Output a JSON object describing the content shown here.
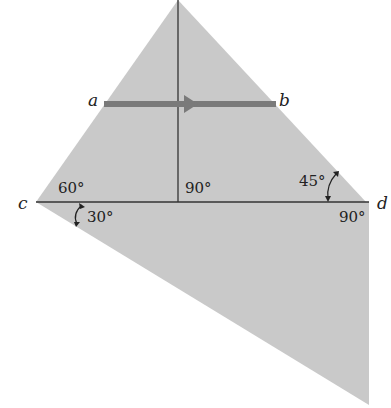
{
  "diagram": {
    "type": "prism_ray_diagram",
    "colors": {
      "prism_fill": "#c9c9c9",
      "line": "#333333",
      "ray": "#7a7a7a",
      "text": "#222222",
      "background": "#ffffff"
    },
    "points": {
      "a": "a",
      "b": "b",
      "c": "c",
      "d": "d"
    },
    "angles": {
      "upper_left": "60°",
      "upper_middle": "90°",
      "upper_right": "45°",
      "lower_left": "30°",
      "lower_right": "90°"
    }
  }
}
